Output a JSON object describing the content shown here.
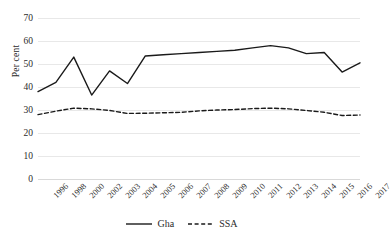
{
  "chart_data": {
    "type": "line",
    "title": "",
    "xlabel": "",
    "ylabel": "Per cent",
    "ylim": [
      0,
      70
    ],
    "yticks": [
      0,
      10,
      20,
      30,
      40,
      50,
      60,
      70
    ],
    "grid": true,
    "legend_position": "bottom",
    "categories": [
      "1996",
      "1998",
      "2000",
      "2002",
      "2003",
      "2004",
      "2005",
      "2006",
      "2007",
      "2008",
      "2009",
      "2010",
      "2011",
      "2012",
      "2013",
      "2014",
      "2015",
      "2016",
      "2017"
    ],
    "series": [
      {
        "name": "Gha",
        "style": "solid",
        "color": "#1a1a1a",
        "values": [
          38,
          42,
          53,
          36.5,
          47,
          41.5,
          53.5,
          54,
          54.5,
          55,
          55.5,
          56,
          57,
          58,
          57,
          54.5,
          55,
          46.5,
          50.5
        ]
      },
      {
        "name": "SSA",
        "style": "dashed",
        "color": "#1a1a1a",
        "values": [
          28,
          29.5,
          30.8,
          30.5,
          29.8,
          28.5,
          28.6,
          28.8,
          29,
          29.6,
          30,
          30.2,
          30.6,
          30.8,
          30.5,
          29.8,
          29,
          27.6,
          27.8
        ]
      }
    ]
  },
  "legend": {
    "items": [
      {
        "label": "Gha",
        "marker": "solid-line-swatch"
      },
      {
        "label": "SSA",
        "marker": "dashed-line-swatch"
      }
    ]
  }
}
